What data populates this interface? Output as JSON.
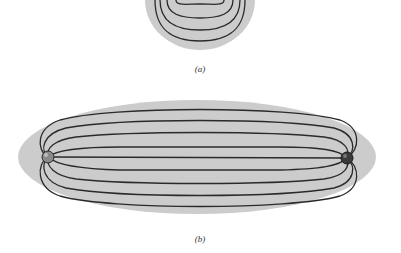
{
  "figure": {
    "part_a": {
      "caption": "(a)",
      "region_color": "#cccccc",
      "line_color": "#2a2a2a"
    },
    "part_b": {
      "caption": "(b)",
      "region_color": "#cccccc",
      "line_color": "#2a2a2a",
      "charges": [
        {
          "name": "left-charge",
          "fill": "#8a8a8a"
        },
        {
          "name": "right-charge",
          "fill": "#3a3a3a"
        }
      ]
    }
  }
}
